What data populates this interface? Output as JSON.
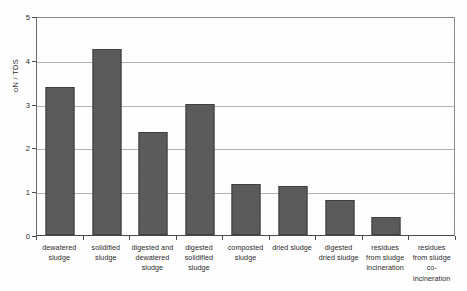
{
  "chart_data": {
    "type": "bar",
    "title": "",
    "xlabel": "",
    "ylabel": "oN / TDS",
    "ylim": [
      0,
      5
    ],
    "yticks": [
      0,
      1,
      2,
      3,
      4,
      5
    ],
    "ytick_labels": [
      "0",
      "1",
      "2",
      "3",
      "4",
      "5"
    ],
    "grid": true,
    "legend": "none",
    "bar_color": "#5b5b5b",
    "categories": [
      "dewatered sludge",
      "solidified sludge",
      "digested and dewatered sludge",
      "digested solidified sludge",
      "composted sludge",
      "dried sludge",
      "digested dried sludge",
      "residues from sludge incineration",
      "residues from sludge co-incineration"
    ],
    "category_lines": [
      [
        "dewatered",
        "sludge"
      ],
      [
        "solidified",
        "sludge"
      ],
      [
        "digested and",
        "dewatered",
        "sludge"
      ],
      [
        "digested",
        "solidified",
        "sludge"
      ],
      [
        "composted",
        "sludge"
      ],
      [
        "dried sludge"
      ],
      [
        "digested",
        "dried sludge"
      ],
      [
        "residues",
        "from sludge",
        "incineration"
      ],
      [
        "residues",
        "from sludge",
        "co-",
        "incineration"
      ]
    ],
    "values": [
      3.38,
      4.25,
      2.35,
      3.0,
      1.17,
      1.11,
      0.79,
      0.42,
      0
    ]
  }
}
